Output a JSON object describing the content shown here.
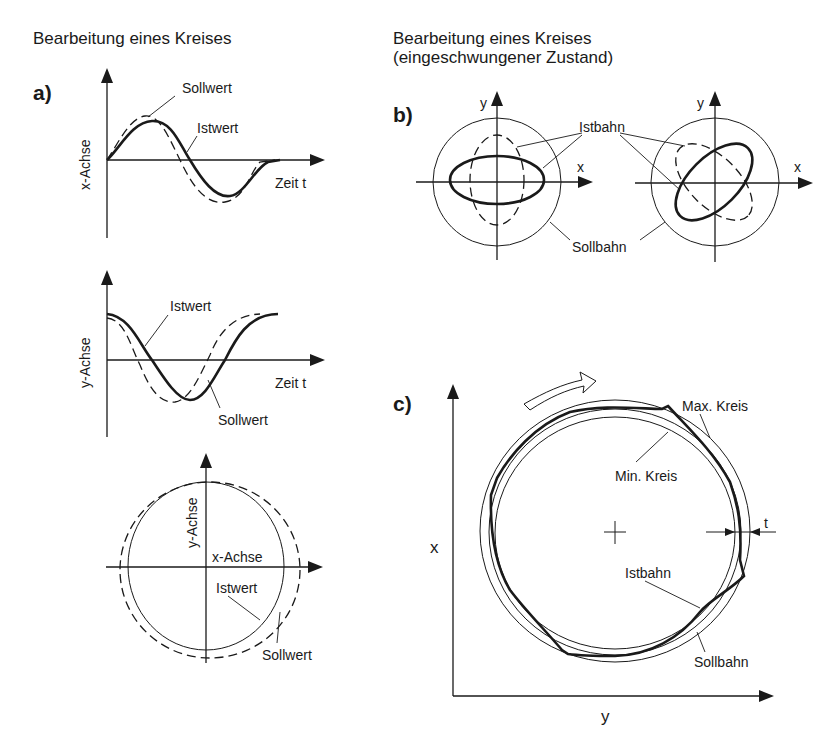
{
  "left": {
    "title": "Bearbeitung eines Kreises",
    "panel_a": {
      "label": "a)",
      "x_chart": {
        "ylabel": "x-Achse",
        "xlabel": "Zeit  t",
        "setpoint_label": "Sollwert",
        "actual_label": "Istwert"
      },
      "y_chart": {
        "ylabel": "y-Achse",
        "xlabel": "Zeit  t",
        "setpoint_label": "Sollwert",
        "actual_label": "Istwert"
      },
      "circle_chart": {
        "y_axis_label": "y-Achse",
        "x_axis_label": "x-Achse",
        "actual_label": "Istwert",
        "setpoint_label": "Sollwert"
      }
    }
  },
  "right": {
    "title_line1": "Bearbeitung eines Kreises",
    "title_line2": "(eingeschwungener Zustand)",
    "panel_b": {
      "label": "b)",
      "y_label_left": "y",
      "x_label_left": "x",
      "y_label_right": "y",
      "x_label_right": "x",
      "actual_path_label": "Istbahn",
      "target_path_label": "Sollbahn"
    },
    "panel_c": {
      "label": "c)",
      "max_circle_label": "Max. Kreis",
      "min_circle_label": "Min. Kreis",
      "tolerance_label": "t",
      "actual_path_label": "Istbahn",
      "target_path_label": "Sollbahn",
      "x_axis_label": "x",
      "y_axis_label": "y",
      "direction_icon": "rotation-arrow-icon"
    }
  }
}
